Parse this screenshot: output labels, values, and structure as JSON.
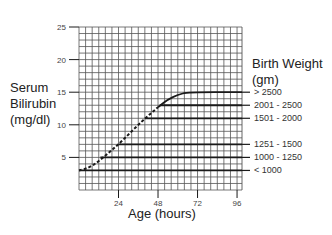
{
  "chart_data": {
    "type": "line",
    "title": "",
    "xlabel": "Age (hours)",
    "ylabel_lines": [
      "Serum",
      "Bilirubin",
      "(mg/dl)"
    ],
    "xlim": [
      0,
      99
    ],
    "ylim": [
      0,
      25
    ],
    "grid": true,
    "grid_x_step": 4,
    "grid_y_step": 1,
    "x_ticks": [
      24,
      48,
      72,
      96
    ],
    "x_tick_labels": [
      "24",
      "48",
      "72",
      "96"
    ],
    "y_ticks": [
      5,
      10,
      15,
      20,
      25
    ],
    "y_tick_labels": [
      "5",
      "10",
      "15",
      "20",
      "25"
    ],
    "legend_title_lines": [
      "Birth Weight",
      "(gm)"
    ],
    "legend_placement": "right",
    "shared_curve": {
      "name": "rising bilirubin (dashed)",
      "style": "dashed",
      "points": [
        [
          0,
          3
        ],
        [
          6,
          3.4
        ],
        [
          12,
          4.4
        ],
        [
          18,
          5.7
        ],
        [
          24,
          7
        ],
        [
          30,
          8.5
        ],
        [
          36,
          10
        ],
        [
          42,
          11.4
        ],
        [
          48,
          12.7
        ]
      ]
    },
    "series": [
      {
        "name": "> 2500",
        "label": "> 2500",
        "level": 15,
        "points": [
          [
            48,
            12.7
          ],
          [
            54,
            13.9
          ],
          [
            60,
            14.6
          ],
          [
            66,
            15
          ],
          [
            99,
            15
          ]
        ]
      },
      {
        "name": "2001 - 2500",
        "label": "2001 - 2500",
        "level": 13,
        "points": [
          [
            49,
            13
          ],
          [
            99,
            13
          ]
        ]
      },
      {
        "name": "1501 - 2000",
        "label": "1501 - 2000",
        "level": 11,
        "points": [
          [
            40,
            11
          ],
          [
            99,
            11
          ]
        ]
      },
      {
        "name": "1251 - 1500",
        "label": "1251 - 1500",
        "level": 7,
        "points": [
          [
            24,
            7
          ],
          [
            99,
            7
          ]
        ]
      },
      {
        "name": "1000 - 1250",
        "label": "1000 - 1250",
        "level": 5,
        "points": [
          [
            13,
            5
          ],
          [
            99,
            5
          ]
        ]
      },
      {
        "name": "< 1000",
        "label": "< 1000",
        "level": 3,
        "points": [
          [
            0,
            3
          ],
          [
            99,
            3
          ]
        ]
      }
    ]
  },
  "colors": {
    "grid": "#555555",
    "line": "#1a1a1a",
    "text": "#222222"
  }
}
